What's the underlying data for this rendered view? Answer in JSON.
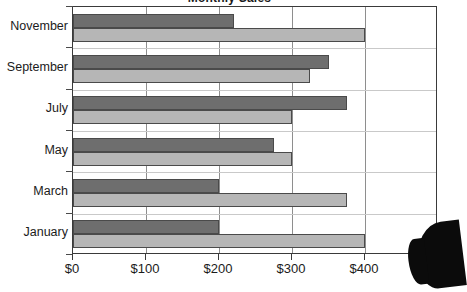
{
  "chart_data": {
    "type": "bar",
    "orientation": "horizontal",
    "title": "Monthly Sales",
    "xlabel": "",
    "ylabel": "",
    "categories": [
      "January",
      "March",
      "May",
      "July",
      "September",
      "November"
    ],
    "series": [
      {
        "name": "Series 1",
        "color": "#b6b6b6",
        "values": [
          400,
          375,
          300,
          300,
          325,
          400
        ]
      },
      {
        "name": "Series 2",
        "color": "#6e6e6e",
        "values": [
          200,
          200,
          275,
          375,
          350,
          220
        ]
      }
    ],
    "xlim": [
      0,
      500
    ],
    "xticks": [
      0,
      100,
      200,
      300,
      400,
      500
    ],
    "xtick_labels": [
      "$0",
      "$100",
      "$200",
      "$300",
      "$400",
      "$500"
    ],
    "xtick_labels_display": [
      "$0",
      "$100",
      "$200",
      "$300",
      "$400",
      "$50"
    ],
    "grid": "vertical-and-horizontal",
    "legend": "none",
    "category_order_top_to_bottom": [
      "November",
      "September",
      "July",
      "May",
      "March",
      "January"
    ]
  },
  "axes": {
    "y_labels_top_to_bottom": [
      "November",
      "September",
      "July",
      "May",
      "March",
      "January"
    ]
  },
  "colors": {
    "series_dark": "#6e6e6e",
    "series_light": "#b6b6b6",
    "axis": "#3a3a3a",
    "gridline_vertical": "#8e8e8e",
    "gridline_horizontal": "#c9c9c9",
    "text": "#1b1b1b",
    "background": "#ffffff"
  }
}
